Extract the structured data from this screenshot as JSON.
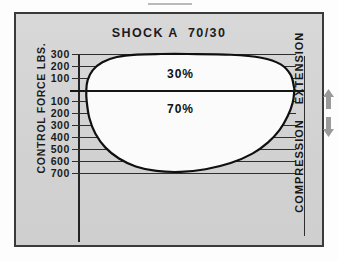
{
  "chart_data": {
    "type": "line",
    "title": "SHOCK A  70/30",
    "ylabel": "CONTROL FORCE LBS.",
    "xlabel": "",
    "grid": true,
    "legend_position": "right",
    "axis_ticks": [
      {
        "label": "300",
        "value": 300,
        "y_frac": 0.0
      },
      {
        "label": "200",
        "value": 200,
        "y_frac": 0.0632
      },
      {
        "label": "100",
        "value": 100,
        "y_frac": 0.1263
      },
      {
        "label": "100",
        "value": -100,
        "y_frac": 0.2526
      },
      {
        "label": "200",
        "value": -200,
        "y_frac": 0.3158
      },
      {
        "label": "300",
        "value": -300,
        "y_frac": 0.3789
      },
      {
        "label": "400",
        "value": -400,
        "y_frac": 0.4421
      },
      {
        "label": "500",
        "value": -500,
        "y_frac": 0.5053
      },
      {
        "label": "600",
        "value": -600,
        "y_frac": 0.5684
      },
      {
        "label": "700",
        "value": -700,
        "y_frac": 0.6316
      }
    ],
    "zero_line_value": 0,
    "zero_line_y_frac": 0.1895,
    "ylim": [
      -700,
      300
    ],
    "annotations": [
      {
        "text": "30%",
        "x_frac": 0.47,
        "y_frac": 0.105,
        "region": "extension"
      },
      {
        "text": "70%",
        "x_frac": 0.47,
        "y_frac": 0.295,
        "region": "compression"
      }
    ],
    "series": [
      {
        "name": "envelope",
        "closed": true,
        "fill": "#fbfbfb",
        "stroke": "#101010",
        "points": [
          [
            0.505,
            0.0
          ],
          [
            0.7,
            0.004
          ],
          [
            0.84,
            0.02
          ],
          [
            0.93,
            0.055
          ],
          [
            0.975,
            0.11
          ],
          [
            0.99,
            0.172
          ],
          [
            0.992,
            0.195
          ],
          [
            0.985,
            0.258
          ],
          [
            0.962,
            0.33
          ],
          [
            0.925,
            0.404
          ],
          [
            0.872,
            0.47
          ],
          [
            0.8,
            0.53
          ],
          [
            0.7,
            0.58
          ],
          [
            0.585,
            0.613
          ],
          [
            0.47,
            0.627
          ],
          [
            0.36,
            0.622
          ],
          [
            0.265,
            0.598
          ],
          [
            0.188,
            0.556
          ],
          [
            0.126,
            0.498
          ],
          [
            0.08,
            0.424
          ],
          [
            0.052,
            0.34
          ],
          [
            0.04,
            0.252
          ],
          [
            0.038,
            0.195
          ],
          [
            0.044,
            0.14
          ],
          [
            0.068,
            0.086
          ],
          [
            0.112,
            0.044
          ],
          [
            0.178,
            0.016
          ],
          [
            0.27,
            0.003
          ],
          [
            0.38,
            0.0
          ],
          [
            0.505,
            0.0
          ]
        ]
      }
    ]
  },
  "figure": {
    "title": "SHOCK A  70/30",
    "y_axis_title": "CONTROL FORCE LBS.",
    "side_labels": {
      "extension": "EXTENSION",
      "compression": "COMPRESSION"
    },
    "arrows": {
      "extension_icon": "arrow-up-icon",
      "compression_icon": "arrow-down-icon",
      "color": "#9a9a9a"
    }
  },
  "colors": {
    "plate_background": "#d6d6d6",
    "frame_border": "#3a3a3a",
    "curve_stroke": "#101010",
    "curve_fill": "#fbfbfb",
    "gridline": "#2e2e2e",
    "zero_line": "#151515",
    "text": "#1a1a1a",
    "page_background": "#fdfdfd"
  }
}
